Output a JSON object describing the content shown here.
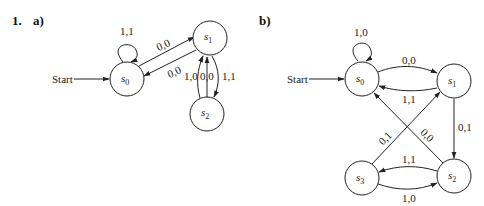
{
  "problem_number": "1.",
  "diagrams": [
    {
      "part": "a)",
      "start_label": "Start",
      "states": [
        {
          "id": "s0",
          "base": "s",
          "sub": "0"
        },
        {
          "id": "s1",
          "base": "s",
          "sub": "1"
        },
        {
          "id": "s2",
          "base": "s",
          "sub": "2"
        }
      ],
      "transitions": [
        {
          "from": "s0",
          "to": "s0",
          "label": "1,1"
        },
        {
          "from": "s0",
          "to": "s1",
          "label": "0,0"
        },
        {
          "from": "s1",
          "to": "s0",
          "label": "0,0"
        },
        {
          "from": "s2",
          "to": "s1",
          "label": "1,0"
        },
        {
          "from": "s2",
          "to": "s1",
          "label": "0,0"
        },
        {
          "from": "s1",
          "to": "s2",
          "label": "1,1"
        }
      ]
    },
    {
      "part": "b)",
      "start_label": "Start",
      "states": [
        {
          "id": "s0",
          "base": "s",
          "sub": "0"
        },
        {
          "id": "s1",
          "base": "s",
          "sub": "1"
        },
        {
          "id": "s2",
          "base": "s",
          "sub": "2"
        },
        {
          "id": "s3",
          "base": "s",
          "sub": "3"
        }
      ],
      "transitions": [
        {
          "from": "s0",
          "to": "s0",
          "label": "1,0"
        },
        {
          "from": "s0",
          "to": "s1",
          "label": "0,0"
        },
        {
          "from": "s1",
          "to": "s0",
          "label": "1,1"
        },
        {
          "from": "s1",
          "to": "s2",
          "label": "0,1"
        },
        {
          "from": "s3",
          "to": "s1",
          "label": "0,1"
        },
        {
          "from": "s2",
          "to": "s0",
          "label": "0,0"
        },
        {
          "from": "s2",
          "to": "s3",
          "label": "1,1"
        },
        {
          "from": "s3",
          "to": "s2",
          "label": "1,0"
        }
      ]
    }
  ]
}
